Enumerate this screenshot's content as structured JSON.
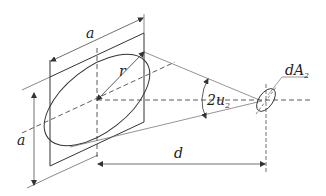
{
  "figure": {
    "labels": {
      "side_top": "a",
      "side_left": "a",
      "radius": "r",
      "angle": "2u",
      "angle_sub": "2",
      "distance": "d",
      "area": "dA",
      "area_sub": "2"
    },
    "colors": {
      "line": "#333333",
      "thin": "#777777",
      "background": "#ffffff"
    }
  }
}
